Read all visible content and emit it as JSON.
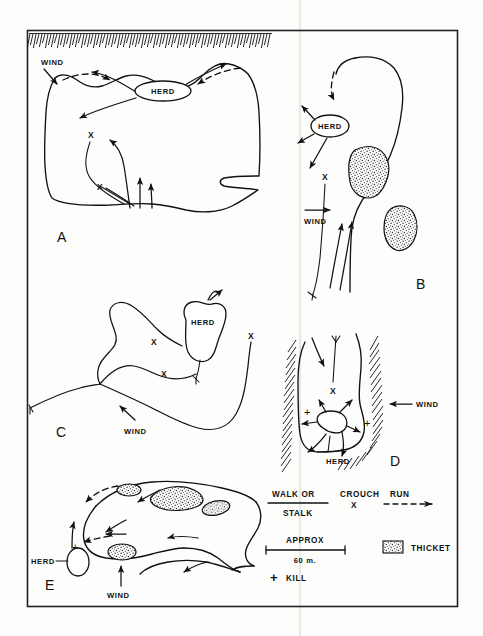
{
  "figure": {
    "title_visible": false,
    "background_color": "#fdfdfc",
    "ink_color": "#111111",
    "frame": {
      "x": 27,
      "y": 30,
      "width": 431,
      "height": 577
    },
    "page_fold_x": 300
  },
  "panels": [
    {
      "id": "A",
      "label": "A",
      "label_pos": {
        "x": 57,
        "y": 242
      },
      "herd_label": "HERD",
      "wind_label": "WIND",
      "x_marks": 2,
      "has_escarpment_hatching": true,
      "has_thicket": false
    },
    {
      "id": "B",
      "label": "B",
      "label_pos": {
        "x": 416,
        "y": 289
      },
      "herd_label": "HERD",
      "wind_label": "WIND",
      "x_marks": 1,
      "has_escarpment_hatching": false,
      "has_thicket": true,
      "thicket_count": 2
    },
    {
      "id": "C",
      "label": "C",
      "label_pos": {
        "x": 56,
        "y": 437
      },
      "herd_label": "HERD",
      "wind_label": "WIND",
      "x_marks": 3,
      "has_escarpment_hatching": false,
      "has_thicket": false
    },
    {
      "id": "D",
      "label": "D",
      "label_pos": {
        "x": 390,
        "y": 466
      },
      "herd_label": "HERD",
      "wind_label": "WIND",
      "x_marks": 1,
      "kill_marks": 2,
      "has_escarpment_hatching": true,
      "has_thicket": false
    },
    {
      "id": "E",
      "label": "E",
      "label_pos": {
        "x": 45,
        "y": 590
      },
      "herd_label": "HERD",
      "wind_label": "WIND",
      "kill_marks": 1,
      "has_escarpment_hatching": false,
      "has_thicket": true,
      "thicket_count": 5
    }
  ],
  "legend": {
    "movement": {
      "walk_or": "WALK OR",
      "stalk": "STALK",
      "crouch": "CROUCH",
      "crouch_symbol": "X",
      "run": "RUN"
    },
    "scale": {
      "approx": "APPROX",
      "distance": "60 m."
    },
    "thicket": {
      "label": "THICKET"
    },
    "kill": {
      "symbol": "+",
      "label": "KILL"
    }
  },
  "labels": {
    "wind": "WIND",
    "herd": "HERD",
    "x": "X",
    "plus": "+"
  }
}
